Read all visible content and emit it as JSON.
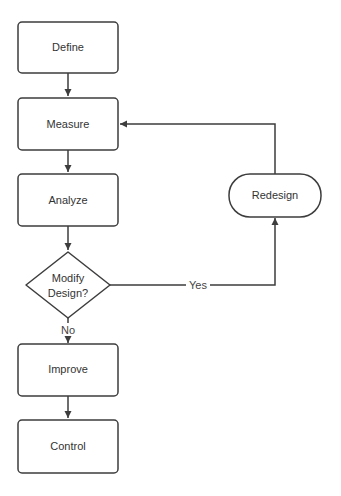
{
  "diagram": {
    "type": "flowchart",
    "colors": {
      "stroke": "#3d3d3d",
      "fill": "#ffffff",
      "text": "#333333"
    },
    "nodes": [
      {
        "id": "define",
        "label": "Define",
        "shape": "rounded-rect"
      },
      {
        "id": "measure",
        "label": "Measure",
        "shape": "rounded-rect"
      },
      {
        "id": "analyze",
        "label": "Analyze",
        "shape": "rounded-rect"
      },
      {
        "id": "modify",
        "label_line1": "Modify",
        "label_line2": "Design?",
        "shape": "diamond"
      },
      {
        "id": "improve",
        "label": "Improve",
        "shape": "rounded-rect"
      },
      {
        "id": "control",
        "label": "Control",
        "shape": "rounded-rect"
      },
      {
        "id": "redesign",
        "label": "Redesign",
        "shape": "stadium"
      }
    ],
    "edges": [
      {
        "from": "define",
        "to": "measure",
        "label": ""
      },
      {
        "from": "measure",
        "to": "analyze",
        "label": ""
      },
      {
        "from": "analyze",
        "to": "modify",
        "label": ""
      },
      {
        "from": "modify",
        "to": "improve",
        "label": "No"
      },
      {
        "from": "modify",
        "to": "redesign",
        "label": "Yes"
      },
      {
        "from": "redesign",
        "to": "measure",
        "label": ""
      },
      {
        "from": "improve",
        "to": "control",
        "label": ""
      }
    ]
  }
}
